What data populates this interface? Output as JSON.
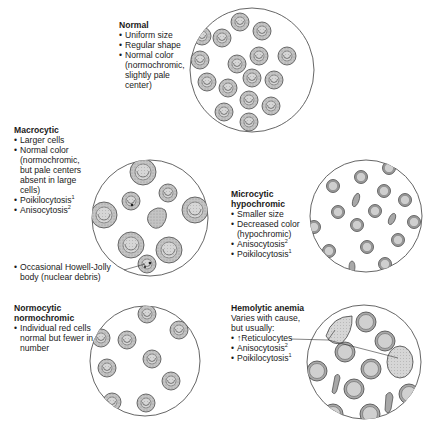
{
  "panels": {
    "normal": {
      "title": "Normal",
      "bullets": [
        "Uniform size",
        "Regular shape",
        "Normal color (normochromic, slightly pale center)"
      ]
    },
    "macrocytic": {
      "title": "Macrocytic",
      "bullets": [
        "Larger cells",
        "Normal color (normochromic, but pale centers absent in large cells)",
        "Poikilocytosis",
        "Anisocytosis"
      ],
      "superscripts": [
        "",
        "",
        "1",
        "2"
      ],
      "callout": "Occasional Howell-Jolly body (nuclear debris)"
    },
    "microcytic": {
      "title_line1": "Microcytic",
      "title_line2": "hypochromic",
      "bullets": [
        "Smaller size",
        "Decreased color (hypochromic)",
        "Anisocytosis",
        "Poikilocytosis"
      ],
      "superscripts": [
        "",
        "",
        "2",
        "1"
      ]
    },
    "normocytic": {
      "title_line1": "Normocytic",
      "title_line2": "normochromic",
      "bullets": [
        "Individual red cells normal but fewer in number"
      ]
    },
    "hemolytic": {
      "title": "Hemolytic anemia",
      "intro": "Varies with cause, but usually:",
      "bullets": [
        "↑Reticulocytes",
        "Anisocytosis",
        "Poikilocytosis"
      ],
      "superscripts": [
        "",
        "2",
        "1"
      ]
    }
  },
  "colors": {
    "cell_fill": "#b8b8b8",
    "cell_center": "#d2d2d2",
    "outline": "#4a4a4a",
    "circle_stroke": "#555555"
  }
}
